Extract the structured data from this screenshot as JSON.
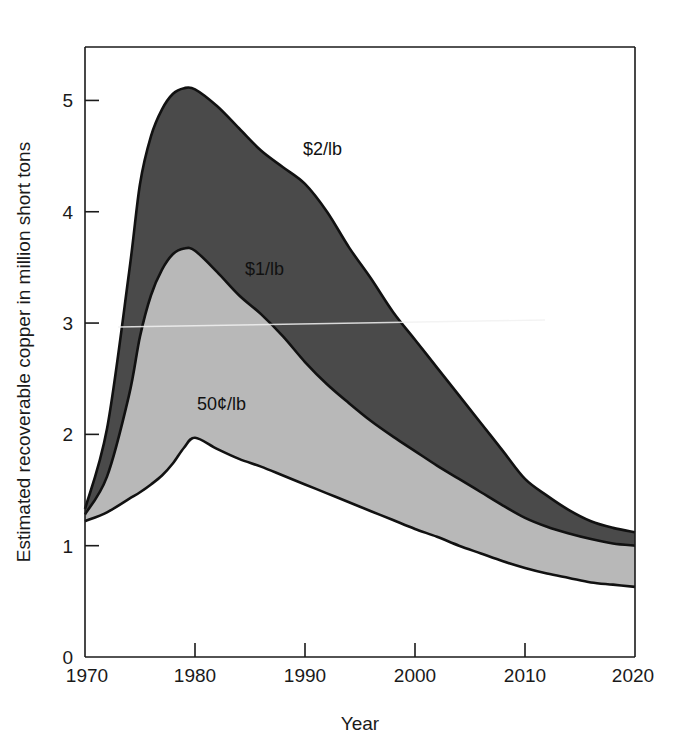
{
  "figure": {
    "background_color": "#ffffff",
    "width": 673,
    "height": 755
  },
  "axes": {
    "x_title": "Year",
    "y_title": "Estimated recoverable copper in million short tons",
    "x_ticks": [
      "1970",
      "1980",
      "1990",
      "2000",
      "2010",
      "2020"
    ],
    "y_ticks": [
      "0",
      "1",
      "2",
      "3",
      "4",
      "5"
    ]
  },
  "labels": {
    "series_2dollar": "$2/lb",
    "series_1dollar": "$1/lb",
    "series_50cent": "50¢/lb"
  },
  "colors": {
    "band_high": "#4a4a4a",
    "band_low": "#b8b8b8",
    "band_base": "#ffffff",
    "outline": "#111111",
    "text": "#1a1a1a"
  },
  "chart_data": {
    "type": "area",
    "title": "",
    "xlabel": "Year",
    "ylabel": "Estimated recoverable copper in million short tons",
    "xlim": [
      1970,
      2020
    ],
    "ylim": [
      0,
      5.48
    ],
    "xticks": [
      1970,
      1980,
      1990,
      2000,
      2010,
      2020
    ],
    "yticks": [
      0,
      1,
      2,
      3,
      4,
      5
    ],
    "grid": false,
    "legend": "inline-annotations",
    "x": [
      1970,
      1972,
      1974,
      1975,
      1976,
      1977,
      1978,
      1979,
      1980,
      1982,
      1984,
      1986,
      1988,
      1990,
      1992,
      1994,
      1996,
      1998,
      2000,
      2002,
      2004,
      2006,
      2008,
      2010,
      2012,
      2014,
      2016,
      2018,
      2020
    ],
    "series": [
      {
        "name": "50¢/lb",
        "fill": "#b8b8b8",
        "annotation": "50¢/lb",
        "values": [
          1.22,
          1.3,
          1.42,
          1.48,
          1.55,
          1.63,
          1.74,
          1.88,
          1.97,
          1.87,
          1.78,
          1.71,
          1.63,
          1.55,
          1.47,
          1.39,
          1.31,
          1.23,
          1.15,
          1.08,
          1.0,
          0.93,
          0.86,
          0.8,
          0.75,
          0.71,
          0.67,
          0.65,
          0.63
        ]
      },
      {
        "name": "$1/lb",
        "fill": "#b8b8b8",
        "annotation": "$1/lb",
        "values": [
          1.28,
          1.62,
          2.35,
          2.88,
          3.25,
          3.48,
          3.62,
          3.67,
          3.65,
          3.46,
          3.25,
          3.08,
          2.88,
          2.65,
          2.45,
          2.28,
          2.12,
          1.98,
          1.85,
          1.72,
          1.6,
          1.48,
          1.36,
          1.25,
          1.17,
          1.11,
          1.06,
          1.02,
          1.0
        ]
      },
      {
        "name": "$2/lb",
        "fill": "#4a4a4a",
        "annotation": "$2/lb",
        "values": [
          1.33,
          2.05,
          3.45,
          4.25,
          4.68,
          4.92,
          5.06,
          5.11,
          5.1,
          4.95,
          4.75,
          4.55,
          4.4,
          4.25,
          4.0,
          3.68,
          3.4,
          3.1,
          2.85,
          2.6,
          2.35,
          2.1,
          1.85,
          1.6,
          1.45,
          1.32,
          1.22,
          1.16,
          1.12
        ]
      }
    ]
  }
}
